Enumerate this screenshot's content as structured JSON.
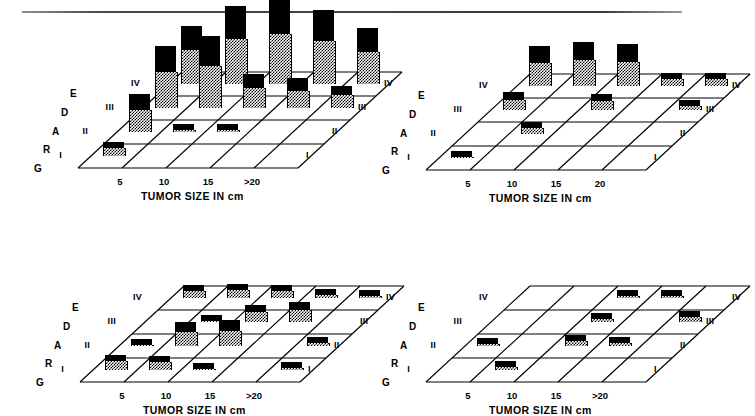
{
  "figure": {
    "axis_caption": "TUMOR  SIZE  IN  cm",
    "grade_axis_letters": [
      "G",
      "R",
      "A",
      "D",
      "E"
    ],
    "row_labels": [
      "I",
      "II",
      "III",
      "IV"
    ]
  },
  "chart_data": [
    {
      "id": "top-left",
      "type": "bar",
      "title": "",
      "xlabel": "TUMOR SIZE IN cm",
      "ylabel": "GRADE",
      "zlabel": "",
      "x_tick_labels": [
        "5",
        "10",
        "15",
        ">20"
      ],
      "row_labels": [
        "I",
        "II",
        "III",
        "IV"
      ],
      "columns": 5,
      "rows": 4,
      "note": "values are relative bar heights, 0 = no bar (flat cell)",
      "matrix": [
        {
          "row": "I",
          "values": [
            14,
            0,
            0,
            0,
            0
          ]
        },
        {
          "row": "II",
          "values": [
            38,
            8,
            8,
            0,
            0
          ]
        },
        {
          "row": "III",
          "values": [
            62,
            72,
            34,
            30,
            22
          ]
        },
        {
          "row": "IV",
          "values": [
            58,
            78,
            86,
            74,
            56
          ]
        }
      ]
    },
    {
      "id": "top-right",
      "type": "bar",
      "title": "",
      "xlabel": "TUMOR SIZE IN cm",
      "ylabel": "GRADE",
      "zlabel": "",
      "x_tick_labels": [
        "5",
        "10",
        "15",
        "20"
      ],
      "row_labels": [
        "I",
        "II",
        "III",
        "IV"
      ],
      "columns": 5,
      "rows": 4,
      "note": "values are relative bar heights, 0 = no bar (flat cell)",
      "matrix": [
        {
          "row": "I",
          "values": [
            7,
            0,
            0,
            0,
            0
          ]
        },
        {
          "row": "II",
          "values": [
            0,
            12,
            0,
            0,
            0
          ]
        },
        {
          "row": "III",
          "values": [
            18,
            0,
            16,
            0,
            10
          ]
        },
        {
          "row": "IV",
          "values": [
            40,
            44,
            42,
            13,
            13,
            13
          ]
        }
      ]
    },
    {
      "id": "bottom-left",
      "type": "bar",
      "title": "",
      "xlabel": "TUMOR SIZE IN cm",
      "ylabel": "GRADE",
      "zlabel": "",
      "x_tick_labels": [
        "5",
        "10",
        "15",
        ">20"
      ],
      "row_labels": [
        "I",
        "II",
        "III",
        "IV"
      ],
      "columns": 5,
      "rows": 4,
      "note": "values are relative bar heights, 0 = no bar (flat cell)",
      "matrix": [
        {
          "row": "I",
          "values": [
            15,
            14,
            7,
            0,
            8
          ]
        },
        {
          "row": "II",
          "values": [
            7,
            24,
            26,
            0,
            9
          ]
        },
        {
          "row": "III",
          "values": [
            0,
            7,
            17,
            20,
            0
          ]
        },
        {
          "row": "IV",
          "values": [
            13,
            14,
            13,
            9,
            8
          ]
        }
      ]
    },
    {
      "id": "bottom-right",
      "type": "bar",
      "title": "",
      "xlabel": "TUMOR SIZE IN cm",
      "ylabel": "GRADE",
      "zlabel": "",
      "x_tick_labels": [
        "5",
        "10",
        "15",
        ">20"
      ],
      "row_labels": [
        "I",
        "II",
        "III",
        "IV"
      ],
      "columns": 5,
      "rows": 4,
      "note": "values are relative bar heights, 0 = no bar (flat cell)",
      "matrix": [
        {
          "row": "I",
          "values": [
            0,
            9,
            0,
            0,
            0
          ]
        },
        {
          "row": "II",
          "values": [
            8,
            0,
            11,
            9,
            0
          ]
        },
        {
          "row": "III",
          "values": [
            0,
            0,
            9,
            0,
            11
          ]
        },
        {
          "row": "IV",
          "values": [
            0,
            0,
            8,
            8,
            0
          ]
        }
      ]
    }
  ]
}
